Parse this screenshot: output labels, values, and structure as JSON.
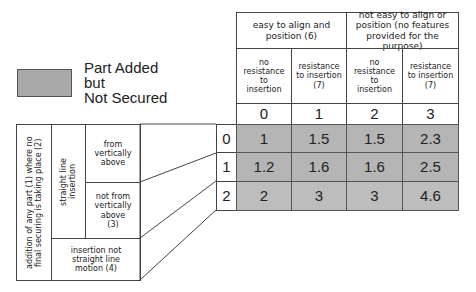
{
  "legend": {
    "swatch_color": "#a9a9a9",
    "line1": "Part Added",
    "line2": "but",
    "line3": "Not Secured"
  },
  "header": {
    "group1": "easy to align and position (6)",
    "group2": "not easy to align or position (no features provided for the purpose)",
    "subcols": [
      "no resistance to insertion",
      "resistance to insertion (7)",
      "no resistance to insertion",
      "resistance to insertion (7)"
    ],
    "col_indices": [
      "0",
      "1",
      "2",
      "3"
    ]
  },
  "left": {
    "outer": "addition of any part (1) where no final securing is taking place (2)",
    "straight": "straight line insertion",
    "from_above": "from vertically above",
    "not_from_above": "not from vertically above (3)",
    "not_straight": "insertion not straight line motion (4)"
  },
  "rows": [
    {
      "index": "0",
      "values": [
        "1",
        "1.5",
        "1.5",
        "2.3"
      ]
    },
    {
      "index": "1",
      "values": [
        "1.2",
        "1.6",
        "1.6",
        "2.5"
      ]
    },
    {
      "index": "2",
      "values": [
        "2",
        "3",
        "3",
        "4.6"
      ]
    }
  ],
  "colors": {
    "shade": "#b5b5b5",
    "border": "#444444"
  }
}
